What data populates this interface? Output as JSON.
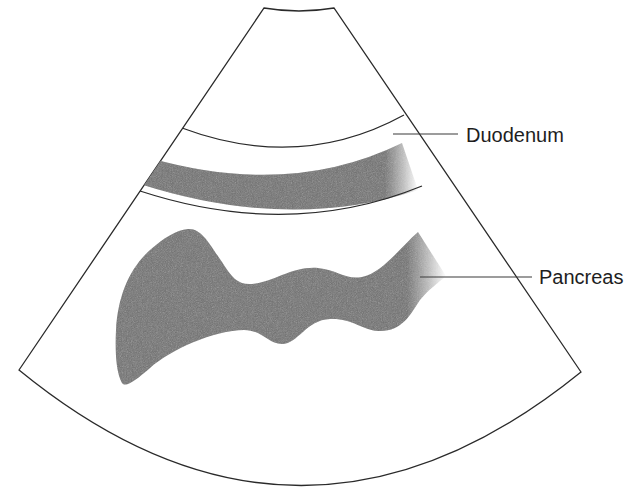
{
  "figure": {
    "kind": "ultrasound-sector-schematic",
    "colors": {
      "background": "#ffffff",
      "outline": "#2a2a2a",
      "tissue": "#6f6f6f",
      "label_text": "#1e1e1e"
    }
  },
  "labels": {
    "duodenum": "Duodenum",
    "pancreas": "Pancreas"
  }
}
